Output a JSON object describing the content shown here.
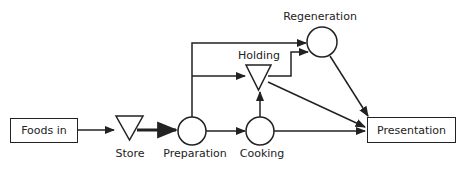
{
  "diagram": {
    "type": "flow",
    "nodes": [
      {
        "id": "foods_in",
        "label": "Foods in",
        "shape": "rectangle"
      },
      {
        "id": "store",
        "label": "Store",
        "shape": "inverted-triangle"
      },
      {
        "id": "preparation",
        "label": "Preparation",
        "shape": "circle"
      },
      {
        "id": "cooking",
        "label": "Cooking",
        "shape": "circle"
      },
      {
        "id": "holding",
        "label": "Holding",
        "shape": "inverted-triangle"
      },
      {
        "id": "regeneration",
        "label": "Regeneration",
        "shape": "circle"
      },
      {
        "id": "presentation",
        "label": "Presentation",
        "shape": "rectangle"
      }
    ],
    "edges": [
      {
        "from": "foods_in",
        "to": "store"
      },
      {
        "from": "store",
        "to": "preparation",
        "emphasis": "bold"
      },
      {
        "from": "preparation",
        "to": "cooking"
      },
      {
        "from": "preparation",
        "to": "regeneration"
      },
      {
        "from": "preparation",
        "to": "holding"
      },
      {
        "from": "cooking",
        "to": "holding"
      },
      {
        "from": "cooking",
        "to": "presentation"
      },
      {
        "from": "holding",
        "to": "regeneration"
      },
      {
        "from": "holding",
        "to": "presentation"
      },
      {
        "from": "regeneration",
        "to": "presentation"
      }
    ]
  },
  "labels": {
    "foods_in": "Foods in",
    "store": "Store",
    "preparation": "Preparation",
    "cooking": "Cooking",
    "holding": "Holding",
    "regeneration": "Regeneration",
    "presentation": "Presentation"
  },
  "colors": {
    "stroke": "#222222",
    "background": "#ffffff"
  }
}
